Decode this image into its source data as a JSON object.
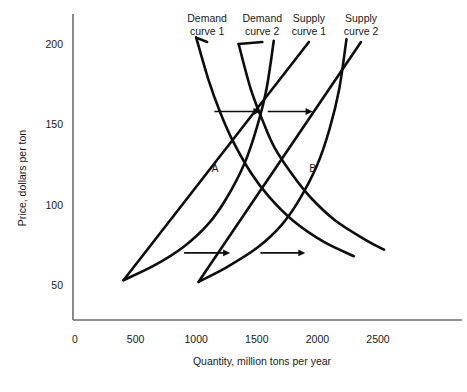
{
  "chart_data": {
    "type": "line",
    "title": "",
    "xlabel": "Quantity, million tons per year",
    "ylabel": "Price, dollars per ton",
    "xlim": [
      0,
      2600
    ],
    "ylim": [
      30,
      215
    ],
    "xticks": [
      "0",
      "500",
      "1000",
      "1500",
      "2000",
      "2500"
    ],
    "xtick_values": [
      0,
      500,
      1000,
      1500,
      2000,
      2500
    ],
    "yticks": [
      "50",
      "100",
      "150",
      "200"
    ],
    "ytick_values": [
      50,
      100,
      150,
      200
    ],
    "grid": false,
    "legend_position": "above-curves",
    "series": [
      {
        "name": "Demand curve 1",
        "kind": "demand",
        "label": "Demand\ncurve 1",
        "label_line1": "Demand",
        "label_line2": "curve 1",
        "points": [
          [
            1000,
            204
          ],
          [
            1100,
            178
          ],
          [
            1200,
            157
          ],
          [
            1300,
            140
          ],
          [
            1450,
            120
          ],
          [
            1600,
            105
          ],
          [
            1800,
            90
          ],
          [
            2050,
            77
          ],
          [
            2300,
            68
          ]
        ]
      },
      {
        "name": "Demand curve 2",
        "kind": "demand",
        "label": "Demand\ncurve 2",
        "label_line1": "Demand",
        "label_line2": "curve 2",
        "points": [
          [
            1350,
            200
          ],
          [
            1450,
            172
          ],
          [
            1550,
            152
          ],
          [
            1650,
            135
          ],
          [
            1800,
            118
          ],
          [
            1950,
            104
          ],
          [
            2150,
            90
          ],
          [
            2400,
            78
          ],
          [
            2550,
            72
          ]
        ]
      },
      {
        "name": "Supply curve 1",
        "kind": "supply",
        "label": "Supply\ncurve 1",
        "label_line1": "Supply",
        "label_line2": "curve 1",
        "points": [
          [
            400,
            53
          ],
          [
            650,
            62
          ],
          [
            900,
            74
          ],
          [
            1100,
            88
          ],
          [
            1250,
            104
          ],
          [
            1400,
            126
          ],
          [
            1500,
            148
          ],
          [
            1580,
            172
          ],
          [
            1640,
            202
          ]
        ]
      },
      {
        "name": "Supply curve 2",
        "kind": "supply",
        "label": "Supply\ncurve 2",
        "label_line1": "Supply",
        "label_line2": "curve 2",
        "points": [
          [
            1020,
            52
          ],
          [
            1250,
            61
          ],
          [
            1500,
            73
          ],
          [
            1700,
            87
          ],
          [
            1850,
            103
          ],
          [
            2000,
            125
          ],
          [
            2100,
            147
          ],
          [
            2180,
            172
          ],
          [
            2240,
            203
          ]
        ]
      }
    ],
    "annotations": [
      {
        "text": "A",
        "x": 1300,
        "y": 120,
        "name": "point-a"
      },
      {
        "text": "B",
        "x": 1850,
        "y": 120,
        "name": "point-b"
      }
    ],
    "arrows": [
      {
        "name": "upper-left-shift-arrow",
        "x_start": 1150,
        "x_end": 1530,
        "y": 158
      },
      {
        "name": "upper-right-shift-arrow",
        "x_start": 1590,
        "x_end": 1960,
        "y": 158
      },
      {
        "name": "lower-left-shift-arrow",
        "x_start": 900,
        "x_end": 1280,
        "y": 70
      },
      {
        "name": "lower-right-shift-arrow",
        "x_start": 1530,
        "x_end": 1900,
        "y": 70
      }
    ]
  },
  "curve_label_positions": [
    {
      "series": 0,
      "x": 1090,
      "y_px": 22
    },
    {
      "series": 1,
      "x": 1545,
      "y_px": 22
    },
    {
      "series": 2,
      "x": 1930,
      "y_px": 22
    },
    {
      "series": 3,
      "x": 2360,
      "y_px": 22
    }
  ]
}
